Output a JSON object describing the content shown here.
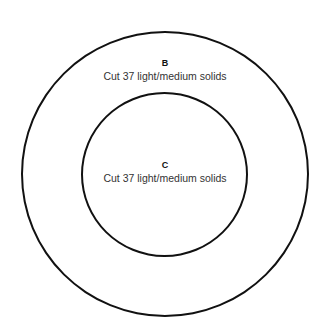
{
  "diagram": {
    "regions": [
      {
        "id": "B",
        "letter": "B",
        "description": "Cut 37 light/medium solids",
        "shape": "outer-ring"
      },
      {
        "id": "C",
        "letter": "C",
        "description": "Cut 37 light/medium solids",
        "shape": "inner-circle"
      }
    ],
    "colors": {
      "stroke": "#111111",
      "background": "#ffffff",
      "text": "#333333"
    }
  }
}
